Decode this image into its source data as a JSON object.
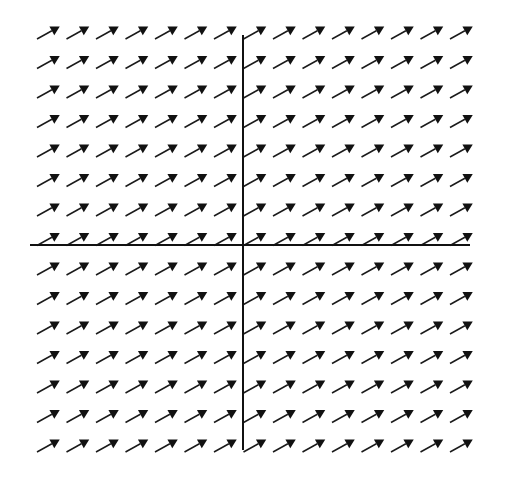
{
  "figure": {
    "type": "direction-field",
    "width": 505,
    "height": 478,
    "background_color": "#ffffff",
    "line_color": "#111111",
    "arrow_color": "#1a1a1a"
  },
  "axes": {
    "x_axis": {
      "label": "x-axis",
      "orientation": "horizontal",
      "y_pixel": 245,
      "x_start_pixel": 30,
      "x_end_pixel": 470,
      "stroke_width": 2
    },
    "y_axis": {
      "label": "y-axis",
      "orientation": "vertical",
      "x_pixel": 243,
      "y_start_pixel": 35,
      "y_end_pixel": 450,
      "stroke_width": 2
    },
    "origin_pixel": [
      243,
      245
    ],
    "tick_labels": [],
    "axis_labels": []
  },
  "chart_data": {
    "type": "scatter",
    "subtype": "slope-field",
    "xlabel": "",
    "ylabel": "",
    "xlim": [
      -7.5,
      7.5
    ],
    "ylim": [
      -7.5,
      7.5
    ],
    "grid": false,
    "legend": null,
    "annotations": [],
    "slope_constant": 0.554,
    "arrow_angle_degrees": 29.0,
    "arrow_length_pixels": 26,
    "arrow_head_length_pixels": 9,
    "arrow_head_width_pixels": 5,
    "grid_columns": 15,
    "grid_rows": 15,
    "grid_spacing_pixels": 29.5,
    "grid_origin_pixel": [
      243,
      245
    ],
    "grid_first_column_pixel": 37,
    "grid_first_row_pixel": 39,
    "x": [
      -7,
      -6,
      -5,
      -4,
      -3,
      -2,
      -1,
      0,
      1,
      2,
      3,
      4,
      5,
      6,
      7
    ],
    "y": [
      7,
      6,
      5,
      4,
      3,
      2,
      1,
      0,
      -1,
      -2,
      -3,
      -4,
      -5,
      -6,
      -7
    ],
    "slopes_uniform": true
  }
}
